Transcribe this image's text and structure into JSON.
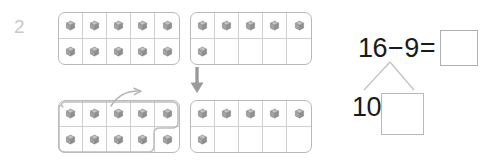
{
  "problem": {
    "number": "2"
  },
  "icons": {
    "cube": "cube-icon",
    "down_arrow": "arrow-down-icon",
    "curved_arrow": "curved-arrow-icon",
    "lasso": "lasso-circle-icon"
  },
  "colors": {
    "frame_border": "#b9b9b9",
    "grid_line": "#cfcfcf",
    "cube_fill": "#9d9d9d",
    "text": "#1a1a1a",
    "problem_number": "#c9c9c9",
    "arrow": "#9a9a9a",
    "box_border": "#b0b0b0"
  },
  "ten_frames": [
    {
      "id": "top-left",
      "label": "ten-frame-top-left",
      "capacity": 10,
      "filled": 10,
      "rows": [
        [
          true,
          true,
          true,
          true,
          true
        ],
        [
          true,
          true,
          true,
          true,
          true
        ]
      ]
    },
    {
      "id": "top-right",
      "label": "ten-frame-top-right",
      "capacity": 10,
      "filled": 6,
      "rows": [
        [
          true,
          true,
          true,
          true,
          true
        ],
        [
          true,
          false,
          false,
          false,
          false
        ]
      ]
    },
    {
      "id": "bottom-left",
      "label": "ten-frame-bottom-left",
      "capacity": 10,
      "filled": 10,
      "circled": 9,
      "rows": [
        [
          true,
          true,
          true,
          true,
          true
        ],
        [
          true,
          true,
          true,
          true,
          true
        ]
      ]
    },
    {
      "id": "bottom-right",
      "label": "ten-frame-bottom-right",
      "capacity": 10,
      "filled": 6,
      "rows": [
        [
          true,
          true,
          true,
          true,
          true
        ],
        [
          true,
          false,
          false,
          false,
          false
        ]
      ]
    }
  ],
  "equation": {
    "minuend": "16",
    "minus_sign": "−",
    "subtrahend": "9",
    "equals_sign": "=",
    "answer": ""
  },
  "number_bond": {
    "left_part": "10",
    "right_part": ""
  }
}
